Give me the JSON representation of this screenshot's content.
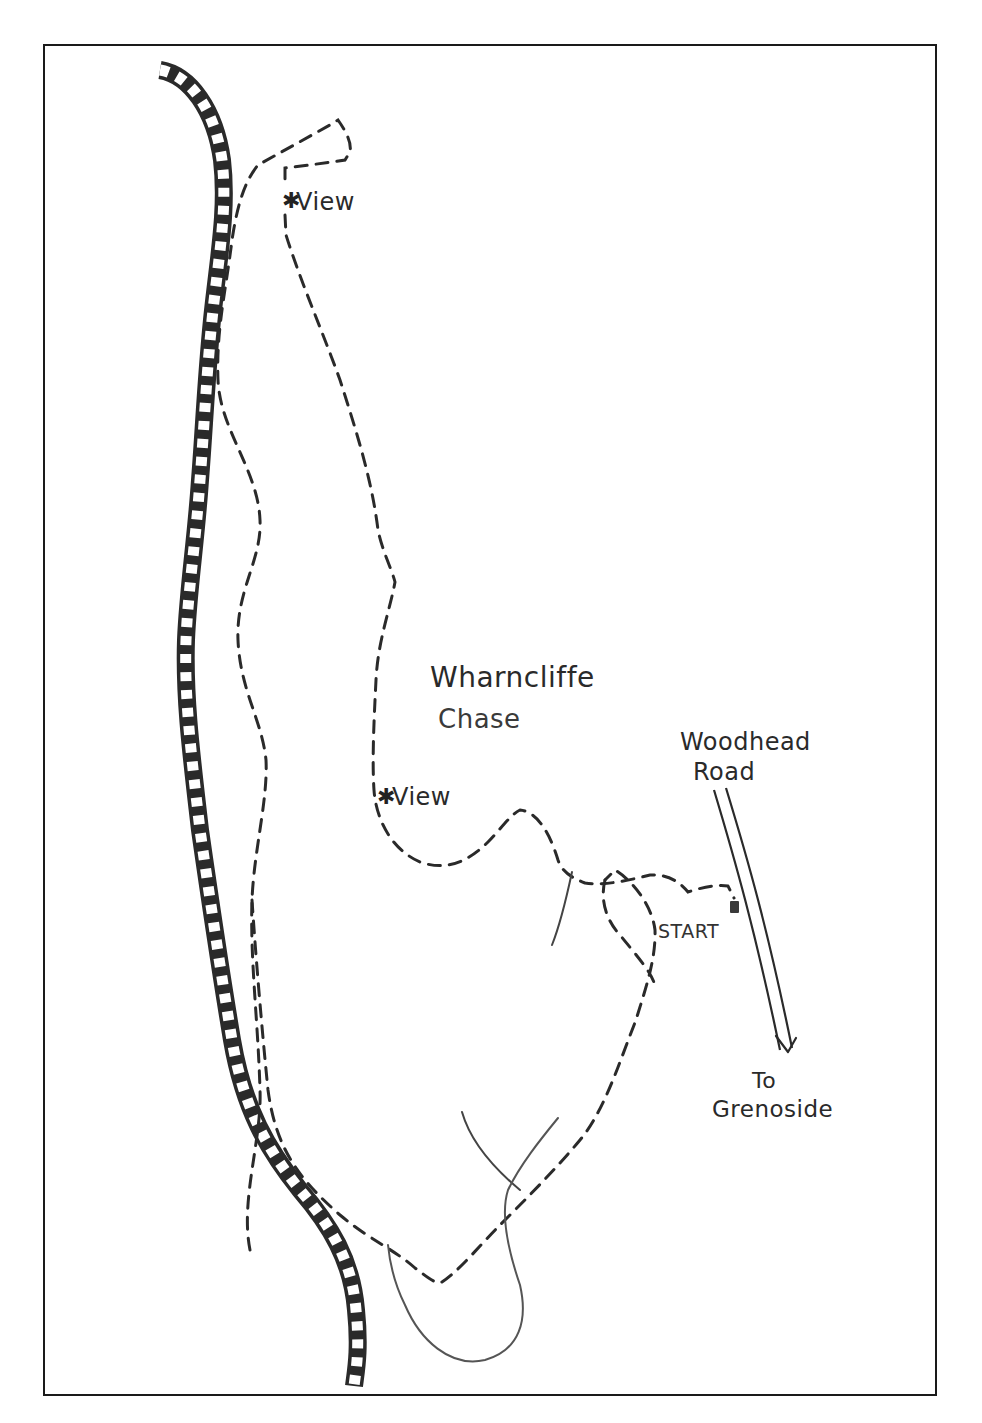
{
  "map": {
    "title_labels": {
      "area_name_line1": "Wharncliffe",
      "area_name_line2": "Chase"
    },
    "road": {
      "name_line1": "Woodhead",
      "name_line2": "Road",
      "direction_line1": "To",
      "direction_line2": "Grenoside"
    },
    "start": {
      "label": "START"
    },
    "viewpoints": [
      {
        "symbol": "✱",
        "label": "View"
      },
      {
        "symbol": "✱",
        "label": "View"
      }
    ],
    "legend_features": {
      "railway": "railway-line",
      "footpath": "dashed-route",
      "stream": "solid-thin-line",
      "road": "double-line-road"
    },
    "colors": {
      "ink": "#2a2a2a",
      "border": "#1a1a1a",
      "background": "#ffffff",
      "stream": "#555555"
    }
  }
}
